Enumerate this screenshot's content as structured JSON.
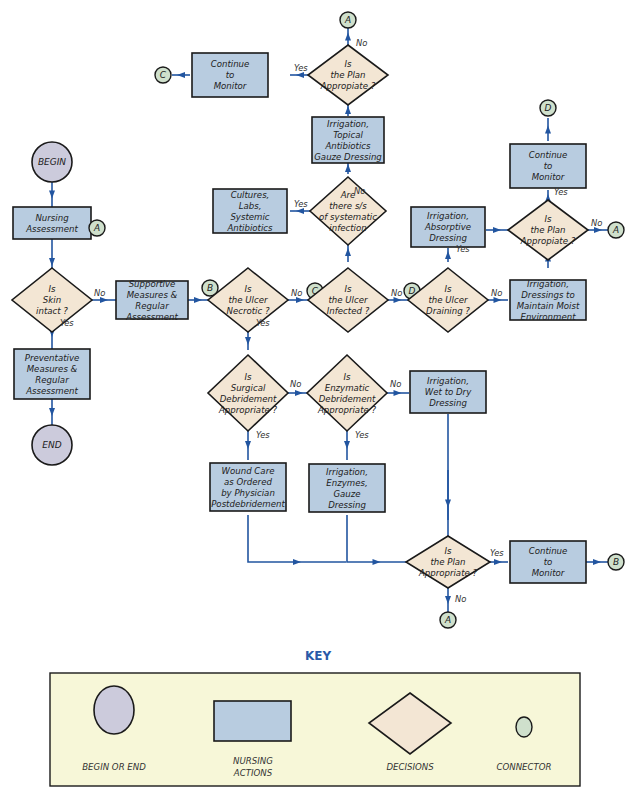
{
  "nodes": {
    "begin": "BEGIN",
    "end": "END",
    "nursing_assessment": [
      "Nursing",
      "Assessment"
    ],
    "skin_intact": [
      "Is",
      "Skin",
      "intact ?"
    ],
    "preventative": [
      "Preventative",
      "Measures &",
      "Regular",
      "Assessment"
    ],
    "supportive": [
      "Supportive",
      "Measures &",
      "Regular",
      "Assessment"
    ],
    "necrotic": [
      "Is",
      "the Ulcer",
      "Necrotic ?"
    ],
    "infected": [
      "Is",
      "the Ulcer",
      "Infected ?"
    ],
    "draining": [
      "Is",
      "the Ulcer",
      "Draining ?"
    ],
    "systemic_q": [
      "Are",
      "there s/s",
      "of systematic",
      "infection"
    ],
    "cultures": [
      "Cultures,",
      "Labs,",
      "Systemic",
      "Antibiotics"
    ],
    "topical": [
      "Irrigation,",
      "Topical",
      "Antibiotics",
      "Gauze Dressing"
    ],
    "plan_top": [
      "Is",
      "the Plan",
      "Appropiate ?"
    ],
    "continue_top": [
      "Continue",
      "to",
      "Monitor"
    ],
    "absorptive": [
      "Irrigation,",
      "Absorptive",
      "Dressing"
    ],
    "moist": [
      "Irrigation,",
      "Dressings to",
      "Maintain Moist",
      "Environment"
    ],
    "plan_right": [
      "Is",
      "the Plan",
      "Appropiate ?"
    ],
    "continue_right": [
      "Continue",
      "to",
      "Monitor"
    ],
    "surgical_q": [
      "Is",
      "Surgical",
      "Debridement",
      "Appropriate ?"
    ],
    "enzymatic_q": [
      "Is",
      "Enzymatic",
      "Debridement",
      "Appropriate ?"
    ],
    "wet_dry": [
      "Irrigation,",
      "Wet to Dry",
      "Dressing"
    ],
    "wound_care": [
      "Wound Care",
      "as Ordered",
      "by Physician",
      "Postdebridement"
    ],
    "enzymes": [
      "Irrigation,",
      "Enzymes,",
      "Gauze",
      "Dressing"
    ],
    "plan_bottom": [
      "Is",
      "the Plan",
      "Appropriate ?"
    ],
    "continue_bottom": [
      "Continue",
      "to",
      "Monitor"
    ]
  },
  "labels": {
    "yes": "Yes",
    "no": "No"
  },
  "connectors": {
    "a": "A",
    "b": "B",
    "c": "C",
    "d": "D"
  },
  "key": {
    "title": "KEY",
    "items": [
      {
        "shape": "circle",
        "label": [
          "BEGIN OR END"
        ]
      },
      {
        "shape": "rectangle",
        "label": [
          "NURSING",
          "ACTIONS"
        ]
      },
      {
        "shape": "diamond",
        "label": [
          "DECISIONS"
        ]
      },
      {
        "shape": "small-circle",
        "label": [
          "CONNECTOR"
        ]
      }
    ]
  },
  "colors": {
    "action": "#b8cce0",
    "decision": "#f3e6d4",
    "terminal": "#cccbdc",
    "connector": "#cfe0cc",
    "flow_line": "#2255a0",
    "key_background": "#f7f7d8",
    "key_title": "#2a5aa8"
  }
}
